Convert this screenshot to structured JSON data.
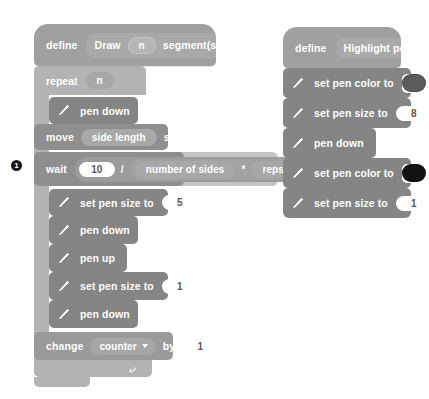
{
  "workspace": {
    "background_color": "#ffffff",
    "marker": {
      "label": "1",
      "color": "#161616"
    }
  },
  "palette": {
    "hat_gray": "#a0a0a0",
    "control_gray": "#b3b3b3",
    "pen_gray": "#858585",
    "motion_gray": "#8f8f8f",
    "variable_gray": "#9a9a9a",
    "operator_gray": "#9b9b9b",
    "highlight_gray": "#c3c3c3",
    "input_white": "#ffffff",
    "text_white": "#ffffff"
  },
  "script_left": {
    "define": {
      "keyword": "define",
      "name_part_1": "Draw",
      "param": "n",
      "name_part_2": "segment(s)"
    },
    "repeat": {
      "keyword": "repeat",
      "times": "n"
    },
    "blocks": [
      {
        "id": "pen-down-1",
        "label": "pen down",
        "icon": "pen-icon"
      },
      {
        "id": "move-1",
        "label_1": "move",
        "value": "side length",
        "label_2": "steps"
      },
      {
        "id": "wait-1",
        "label_1": "wait",
        "numerator": "10",
        "divide_symbol": "/",
        "operand_1": "number of sides",
        "multiply_symbol": "*",
        "operand_2": "reps",
        "label_2": "seconds"
      },
      {
        "id": "set-pen-size-5",
        "label": "set pen size to",
        "value": "5",
        "icon": "pen-icon"
      },
      {
        "id": "pen-down-2",
        "label": "pen down",
        "icon": "pen-icon"
      },
      {
        "id": "pen-up-1",
        "label": "pen up",
        "icon": "pen-icon"
      },
      {
        "id": "set-pen-size-1",
        "label": "set pen size to",
        "value": "1",
        "icon": "pen-icon"
      },
      {
        "id": "pen-down-3",
        "label": "pen down",
        "icon": "pen-icon"
      },
      {
        "id": "change-counter",
        "label_1": "change",
        "variable": "counter",
        "label_2": "by",
        "value": "1"
      }
    ]
  },
  "script_right": {
    "define": {
      "keyword": "define",
      "name": "Highlight point"
    },
    "blocks": [
      {
        "id": "set-pen-color-1",
        "label": "set pen color to",
        "color": "#5b5b5b",
        "icon": "pen-icon"
      },
      {
        "id": "set-pen-size-8",
        "label": "set pen size to",
        "value": "8",
        "icon": "pen-icon"
      },
      {
        "id": "pen-down-r1",
        "label": "pen down",
        "icon": "pen-icon"
      },
      {
        "id": "set-pen-color-2",
        "label": "set pen color to",
        "color": "#121212",
        "icon": "pen-icon"
      },
      {
        "id": "set-pen-size-r1",
        "label": "set pen size to",
        "value": "1",
        "icon": "pen-icon"
      }
    ]
  }
}
